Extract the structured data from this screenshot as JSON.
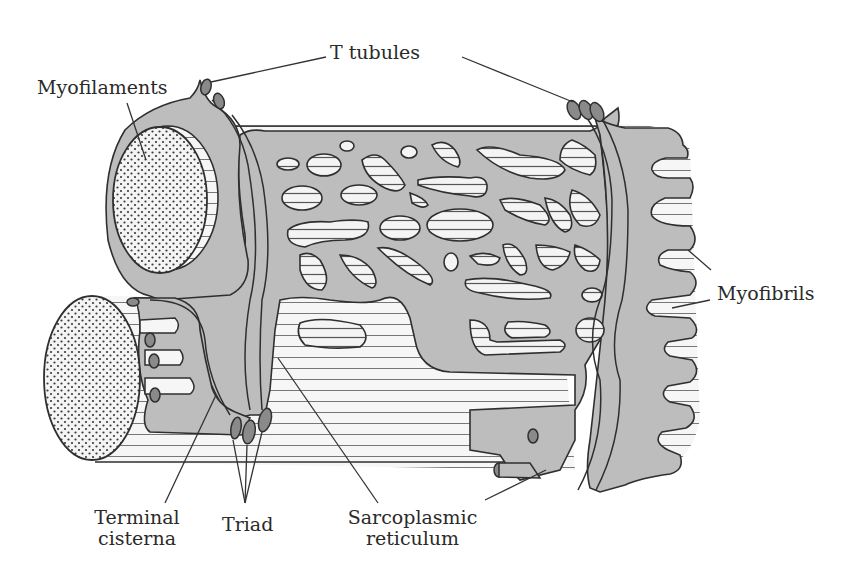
{
  "figure": {
    "colors": {
      "background": "#ffffff",
      "sarcoplasm_fill": "#bdbdbd",
      "outline": "#2f2f2f",
      "t_tubule_fill": "#8a8a8a",
      "myofibril_fill": "#f4f4f4",
      "stipple_dot": "#3a3a3a",
      "leader_line": "#333333"
    }
  },
  "labels": {
    "t_tubules": "T tubules",
    "myofilaments": "Myofilaments",
    "myofibrils": "Myofibrils",
    "terminal_cisterna_line1": "Terminal",
    "terminal_cisterna_line2": "cisterna",
    "triad": "Triad",
    "sarcoplasmic_reticulum_line1": "Sarcoplasmic",
    "sarcoplasmic_reticulum_line2": "reticulum"
  }
}
